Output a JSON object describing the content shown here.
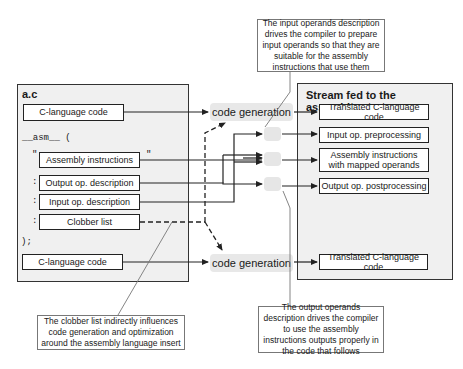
{
  "left_panel": {
    "title": "a.c",
    "c_code_top": "C-language code",
    "asm_keyword": "__asm__ (",
    "quote_open": "\"",
    "quote_close": "\"",
    "assembly_instructions": "Assembly instructions",
    "colon_1": ":",
    "output_desc": "Output op. description",
    "colon_2": ":",
    "input_desc": "Input op. description",
    "colon_3": ":",
    "clobber_list": "Clobber list",
    "close": ");",
    "c_code_bottom": "C-language code"
  },
  "middle": {
    "code_generation_top": "code generation",
    "code_generation_bottom": "code generation"
  },
  "right_panel": {
    "title": "Stream fed to the assembler",
    "items": [
      "Translated C-language code",
      "Input op. preprocessing",
      "Assembly instructions with mapped operands",
      "Output op. postprocessing",
      "Translated C-language code"
    ]
  },
  "callouts": {
    "input_operands": "The input operands description drives the compiler to prepare input operands so that they are suitable for the assembly instructions that use them",
    "clobber": "The clobber list indirectly influences code generation and optimization around the assembly language insert",
    "output_operands": "The output operands description drives the compiler to use the assembly instructions outputs properly in the code that follows"
  },
  "colors": {
    "panel_bg": "#f0f0f0",
    "line": "#222222",
    "blob": "#e6e6e6"
  }
}
